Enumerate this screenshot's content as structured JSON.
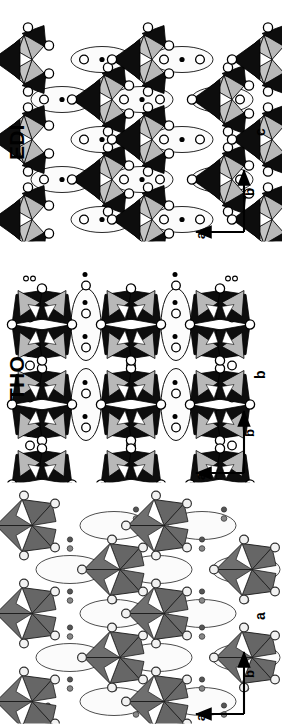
{
  "figure": {
    "type": "crystal-structure-framework-diagram",
    "orientation": "panels rotated 90 degrees counter-clockwise",
    "panel_count": 3,
    "background_color": "#ffffff"
  },
  "legend_colors": {
    "dark_tetrahedron": "#0d0d0d",
    "light_tetrahedron": "#b8b8b8",
    "medium_tetrahedron": "#6a6a6a",
    "atom_fill": "#ffffff",
    "atom_outline": "#000000",
    "small_atom_fill": "#000000",
    "channel_fill": "#fafafa",
    "edge_stroke": "#000000"
  },
  "panels": [
    {
      "id": "edi",
      "title": "EDI",
      "has_title": true,
      "view_label": "c",
      "axes": {
        "vertical_label": "b",
        "horizontal_label": "a",
        "vertical_arrow": "up",
        "horizontal_arrow": "left"
      },
      "tetrahedra_shades": [
        "#b8b8b8",
        "#0d0d0d"
      ],
      "cluster_grid": {
        "cols": 3,
        "rows": 3
      },
      "channel_shape": "lens",
      "channel_count": 6
    },
    {
      "id": "tho",
      "title": "THO",
      "has_title": true,
      "view_label": "b",
      "axes": {
        "vertical_label": "b",
        "horizontal_label": "a",
        "vertical_arrow": "up",
        "horizontal_arrow": "left"
      },
      "tetrahedra_shades": [
        "#b8b8b8",
        "#0d0d0d"
      ],
      "cluster_grid": {
        "cols": 3,
        "rows": 3
      },
      "channel_shape": "lens",
      "channel_count": 4
    },
    {
      "id": "nat",
      "title": "",
      "has_title": false,
      "view_label": "a",
      "axes": {
        "vertical_label": "b",
        "horizontal_label": "a",
        "vertical_arrow": "up",
        "horizontal_arrow": "left"
      },
      "tetrahedra_shades": [
        "#6a6a6a"
      ],
      "cluster_grid": {
        "cols": 3,
        "rows": 3
      },
      "channel_shape": "lens",
      "channel_count": 4
    }
  ]
}
